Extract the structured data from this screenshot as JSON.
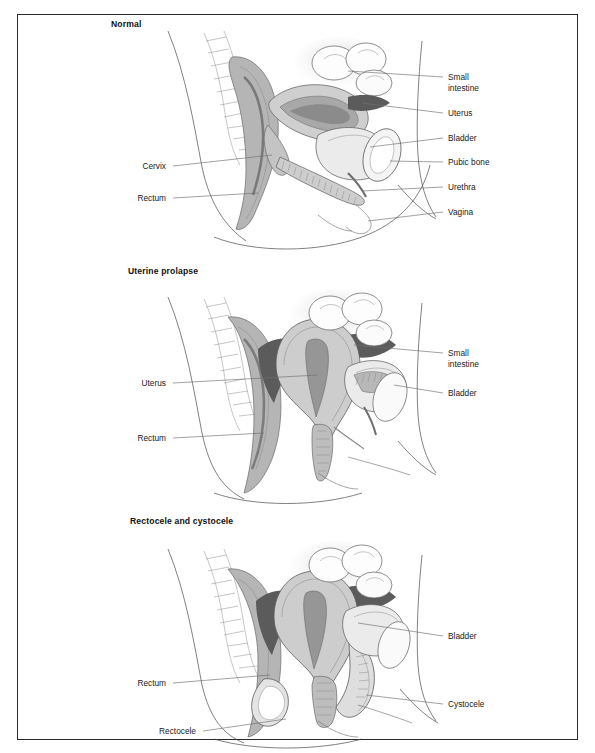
{
  "figure": {
    "title_panel_1": "Normal",
    "title_panel_2": "Uterine prolapse",
    "title_panel_3": "Rectocele and cystocele",
    "border_color": "#2a2a2a",
    "background_color": "#ffffff",
    "leader_line_color": "#6f6f6f",
    "text_color": "#1a1a1a"
  },
  "panels": [
    {
      "name": "normal",
      "title": "Normal",
      "labels_right": [
        {
          "text_line1": "Small",
          "text_line2": "intestine"
        },
        {
          "text_line1": "Uterus",
          "text_line2": ""
        },
        {
          "text_line1": "Bladder",
          "text_line2": ""
        },
        {
          "text_line1": "Pubic bone",
          "text_line2": ""
        },
        {
          "text_line1": "Urethra",
          "text_line2": ""
        },
        {
          "text_line1": "Vagina",
          "text_line2": ""
        }
      ],
      "labels_left": [
        {
          "text_line1": "Cervix",
          "text_line2": ""
        },
        {
          "text_line1": "Rectum",
          "text_line2": ""
        }
      ]
    },
    {
      "name": "uterine-prolapse",
      "title": "Uterine prolapse",
      "labels_right": [
        {
          "text_line1": "Small",
          "text_line2": "intestine"
        },
        {
          "text_line1": "Bladder",
          "text_line2": ""
        }
      ],
      "labels_left": [
        {
          "text_line1": "Uterus",
          "text_line2": ""
        },
        {
          "text_line1": "Rectum",
          "text_line2": ""
        }
      ]
    },
    {
      "name": "rectocele-and-cystocele",
      "title": "Rectocele and cystocele",
      "labels_right": [
        {
          "text_line1": "Bladder",
          "text_line2": ""
        },
        {
          "text_line1": "Cystocele",
          "text_line2": ""
        }
      ],
      "labels_left": [
        {
          "text_line1": "Rectum",
          "text_line2": ""
        },
        {
          "text_line1": "Rectocele",
          "text_line2": ""
        }
      ]
    }
  ],
  "palette": {
    "tone_darkest": "#4f4f4f",
    "tone_dark": "#6e6e6e",
    "tone_mid": "#9b9b9b",
    "tone_light": "#bdbdbd",
    "tone_lighter": "#d8d8d8",
    "tone_pale": "#ececec",
    "tone_white": "#ffffff"
  }
}
